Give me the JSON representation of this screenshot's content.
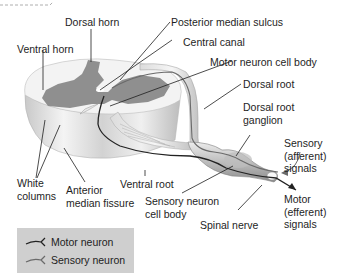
{
  "diagram": {
    "colors": {
      "gray_matter": "#8f8f8f",
      "white_matter": "#f1f1f1",
      "motor_neuron": "#222222",
      "sensory_neuron": "#6a6a6a",
      "legend_bg": "#cfcfcf",
      "leader_line": "#1e1e1e"
    },
    "labels": {
      "dorsal_horn": "Dorsal horn",
      "posterior_median_sulcus": "Posterior median sulcus",
      "ventral_horn": "Ventral horn",
      "central_canal": "Central canal",
      "motor_neuron_cell_body": "Motor neuron cell body",
      "dorsal_root": "Dorsal root",
      "dorsal_root_ganglion_1": "Dorsal root",
      "dorsal_root_ganglion_2": "ganglion",
      "sensory_signals_1": "Sensory",
      "sensory_signals_2": "(afferent)",
      "sensory_signals_3": "signals",
      "white_columns_1": "White",
      "white_columns_2": "columns",
      "anterior_median_fissure_1": "Anterior",
      "anterior_median_fissure_2": "median fissure",
      "ventral_root": "Ventral root",
      "sensory_neuron_cell_body_1": "Sensory neuron",
      "sensory_neuron_cell_body_2": "cell body",
      "spinal_nerve": "Spinal nerve",
      "motor_signals_1": "Motor",
      "motor_signals_2": "(efferent)",
      "motor_signals_3": "signals"
    },
    "legend": {
      "items": [
        {
          "label": "Motor neuron",
          "icon": "motor-neuron-line-icon"
        },
        {
          "label": "Sensory neuron",
          "icon": "sensory-neuron-line-icon"
        }
      ]
    }
  }
}
